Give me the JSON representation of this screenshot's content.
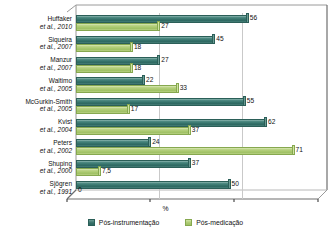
{
  "chart_data": {
    "type": "bar",
    "orientation": "horizontal",
    "title": "",
    "xlabel": "%",
    "ylabel": "",
    "xlim": [
      0,
      80
    ],
    "grid": true,
    "legend_position": "bottom",
    "categories": [
      "Huffaker et al., 2010",
      "Siqueira et al., 2007",
      "Manzur et al., 2007",
      "Waltimo et al., 2005",
      "McGurkin-Smith et al., 2005",
      "Kvist et al., 2004",
      "Peters et al., 2002",
      "Shuping et al., 2000",
      "Sjögren et al., 1991"
    ],
    "series": [
      {
        "name": "Pós-instrumentação",
        "color": "#2e6861",
        "values": [
          56,
          45,
          27,
          22,
          55,
          62,
          24,
          37,
          50
        ],
        "labels": [
          "56",
          "45",
          "27",
          "22",
          "55",
          "62",
          "24",
          "37",
          "50"
        ]
      },
      {
        "name": "Pós-medicação",
        "color": "#9fc065",
        "values": [
          27,
          18,
          18,
          33,
          17,
          37,
          71,
          7.5,
          0
        ],
        "labels": [
          "27",
          "18",
          "18",
          "33",
          "17",
          "37",
          "71",
          "7,5",
          "0"
        ]
      }
    ],
    "axis_zero_label": "0",
    "tick_positions": [
      0,
      26.7,
      53.3,
      80
    ]
  },
  "categories_split": [
    {
      "name": "Huffaker",
      "year": "et al., 2010"
    },
    {
      "name": "Siqueira",
      "year": "et al., 2007"
    },
    {
      "name": "Manzur",
      "year": "et al., 2007"
    },
    {
      "name": "Waltimo",
      "year": "et al., 2005"
    },
    {
      "name": "McGurkin-Smith",
      "year": "et al., 2005"
    },
    {
      "name": "Kvist",
      "year": "et al., 2004"
    },
    {
      "name": "Peters",
      "year": "et al., 2002"
    },
    {
      "name": "Shuping",
      "year": "et al., 2000"
    },
    {
      "name": "Sjögren",
      "year": "et al., 1991"
    }
  ],
  "legend": {
    "items": [
      {
        "label": "Pós-instrumentação",
        "color": "#2e6861"
      },
      {
        "label": "Pós-medicação",
        "color": "#9fc065"
      }
    ]
  },
  "axis": {
    "x_title": "%",
    "zero": "0"
  },
  "values_flat": {
    "huffaker_dark": "56",
    "huffaker_light": "27",
    "siqueira_dark": "45",
    "siqueira_light": "18",
    "manzur_dark": "27",
    "manzur_light": "18",
    "waltimo_dark": "22",
    "waltimo_light": "33",
    "mcgurkin_dark": "55",
    "mcgurkin_light": "17",
    "kvist_dark": "62",
    "kvist_light": "37",
    "peters_dark": "24",
    "peters_light": "71",
    "shuping_dark": "37",
    "shuping_light": "7,5",
    "sjogren_dark": "50",
    "sjogren_light": "0"
  }
}
